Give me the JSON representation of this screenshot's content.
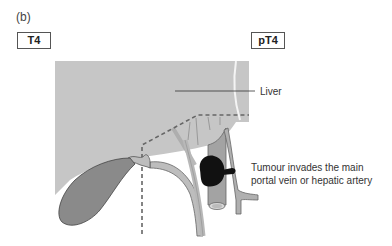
{
  "panel": {
    "label": "(b)"
  },
  "stages": {
    "clinical": "T4",
    "pathological": "pT4"
  },
  "labels": {
    "liver": "Liver",
    "tumour_line1": "Tumour invades the main",
    "tumour_line2": "portal vein or hepatic artery"
  },
  "colors": {
    "liver": "#c6c6c6",
    "gallbladder": "#8a8a8a",
    "vessel": "#b5b5b5",
    "tumour": "#111111",
    "dashed": "#666666"
  }
}
